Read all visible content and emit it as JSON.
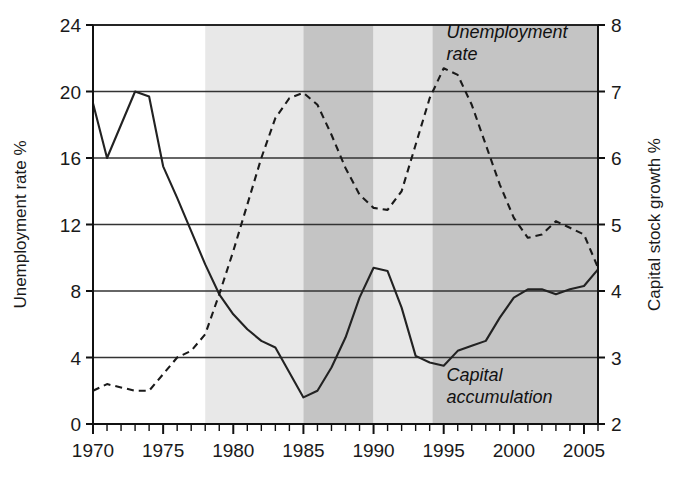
{
  "chart_data": {
    "type": "line",
    "title": "",
    "xlabel": "",
    "ylabel": "Unemployment rate %",
    "y2label": "Capital stock growth %",
    "xlim": [
      1970,
      2006
    ],
    "ylim": [
      0,
      24
    ],
    "y2lim": [
      2,
      8
    ],
    "grid": true,
    "legend_position": "inline-annotations",
    "xticks_major": [
      1970,
      1975,
      1980,
      1985,
      1990,
      1995,
      2000,
      2005
    ],
    "xtick_labels": [
      "1970",
      "1975",
      "1980",
      "1985",
      "1990",
      "1995",
      "2000",
      "2005"
    ],
    "xticks_minor_step": 1,
    "yticks": [
      0,
      4,
      8,
      12,
      16,
      20,
      24
    ],
    "ytick_labels": [
      "0",
      "4",
      "8",
      "12",
      "16",
      "20",
      "24"
    ],
    "y2ticks": [
      2,
      3,
      4,
      5,
      6,
      7,
      8
    ],
    "y2tick_labels": [
      "2",
      "3",
      "4",
      "5",
      "6",
      "7",
      "8"
    ],
    "x": [
      1970,
      1971,
      1972,
      1973,
      1974,
      1975,
      1976,
      1977,
      1978,
      1979,
      1980,
      1981,
      1982,
      1983,
      1984,
      1985,
      1986,
      1987,
      1988,
      1989,
      1990,
      1991,
      1992,
      1993,
      1994,
      1995,
      1996,
      1997,
      1998,
      1999,
      2000,
      2001,
      2002,
      2003,
      2004,
      2005,
      2006
    ],
    "series": [
      {
        "name": "Capital accumulation",
        "axis": "left",
        "style": "solid",
        "color": "#222222",
        "annotation": "Capital\naccumulation",
        "annotation_line1": "Capital",
        "annotation_line2": "accumulation",
        "values": [
          19.3,
          16.0,
          18.0,
          20.0,
          19.7,
          15.5,
          13.6,
          11.6,
          9.6,
          7.8,
          6.6,
          5.7,
          5.0,
          4.6,
          3.1,
          1.6,
          2.0,
          3.4,
          5.2,
          7.6,
          9.4,
          9.2,
          7.0,
          4.1,
          3.7,
          3.5,
          4.4,
          4.7,
          5.0,
          6.4,
          7.6,
          8.1,
          8.1,
          7.8,
          8.1,
          8.3,
          9.3
        ]
      },
      {
        "name": "Unemployment rate",
        "axis": "right",
        "style": "dashed",
        "color": "#1a1a1a",
        "annotation": "Unemployment\nrate",
        "annotation_line1": "Unemployment",
        "annotation_line2": "rate",
        "values": [
          2.5,
          2.6,
          2.55,
          2.5,
          2.5,
          2.75,
          3.0,
          3.1,
          3.35,
          3.95,
          4.6,
          5.3,
          6.0,
          6.6,
          6.9,
          6.98,
          6.8,
          6.35,
          5.85,
          5.45,
          5.25,
          5.22,
          5.5,
          6.2,
          6.9,
          7.35,
          7.25,
          6.8,
          6.2,
          5.6,
          5.1,
          4.8,
          4.85,
          5.05,
          4.95,
          4.85,
          4.35
        ]
      }
    ],
    "shaded_bands": [
      {
        "from": 1970,
        "to": 1978,
        "shade": "#ffffff",
        "name": "band-white-1970-1978"
      },
      {
        "from": 1978,
        "to": 1985,
        "shade": "#e8e8e8",
        "name": "band-light-1978-1985"
      },
      {
        "from": 1985,
        "to": 1990,
        "shade": "#c4c4c4",
        "name": "band-dark-1985-1990"
      },
      {
        "from": 1990,
        "to": 1994.2,
        "shade": "#e8e8e8",
        "name": "band-light-1990-1994"
      },
      {
        "from": 1994.2,
        "to": 2006,
        "shade": "#c4c4c4",
        "name": "band-dark-1994-2006"
      }
    ],
    "annotations": [
      {
        "text_line1": "Unemployment",
        "text_line2": "rate",
        "x": 1995.2,
        "y2": 7.8
      },
      {
        "text_line1": "Capital",
        "text_line2": "accumulation",
        "x": 1995.2,
        "y": 2.6
      }
    ],
    "colors": {
      "axis": "#111111",
      "gridline": "#333333",
      "band_light": "#e8e8e8",
      "band_dark": "#c4c4c4",
      "plot_background": "#ffffff"
    }
  }
}
